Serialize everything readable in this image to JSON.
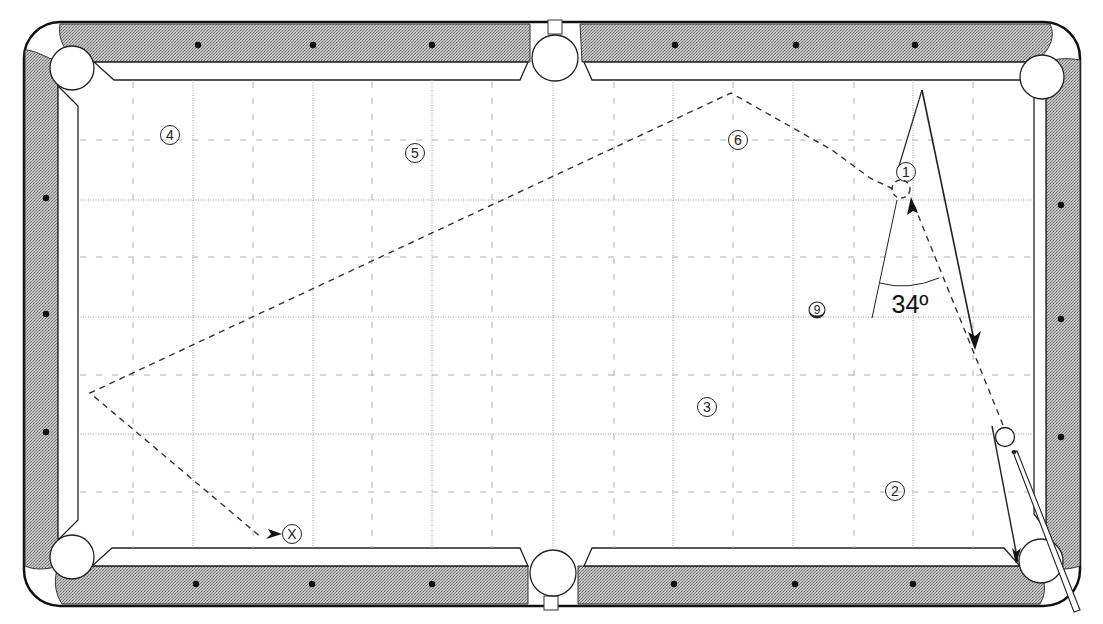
{
  "diagram": {
    "angle_label": "34º",
    "ball_labels": [
      {
        "id": "ball-1",
        "text": "1",
        "x": 906,
        "y": 172
      },
      {
        "id": "ball-2",
        "text": "2",
        "x": 895,
        "y": 491
      },
      {
        "id": "ball-3",
        "text": "3",
        "x": 707,
        "y": 407
      },
      {
        "id": "ball-4",
        "text": "4",
        "x": 170,
        "y": 135
      },
      {
        "id": "ball-5",
        "text": "5",
        "x": 415,
        "y": 153
      },
      {
        "id": "ball-6",
        "text": "6",
        "x": 738,
        "y": 140
      },
      {
        "id": "ball-9",
        "text": "9",
        "x": 817,
        "y": 310
      },
      {
        "id": "target-x",
        "text": "X",
        "x": 292,
        "y": 534
      }
    ],
    "colors": {
      "rail_fill": "#a9a9a9",
      "line": "#222222",
      "grid": "#9a9a9a",
      "felt": "#ffffff"
    }
  }
}
